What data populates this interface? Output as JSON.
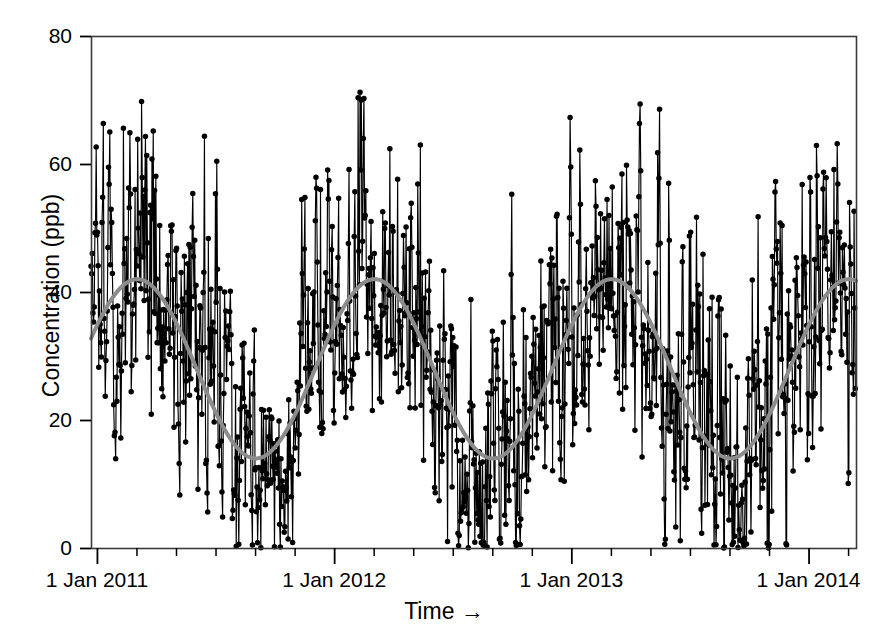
{
  "chart_data": {
    "type": "line",
    "title": "",
    "subtitle": "",
    "xlabel": "Time →",
    "ylabel": "Concentration (ppb)",
    "grid": false,
    "legend": null,
    "x_axis": {
      "tick_labels": [
        "1 Jan 2011",
        "1 Jan 2012",
        "1 Jan 2013",
        "1 Jan 2014"
      ],
      "tick_values": [
        2011.0,
        2012.0,
        2013.0,
        2014.0
      ],
      "range": [
        2010.975,
        2014.2
      ],
      "minor_tick_interval_months": 2
    },
    "y_axis": {
      "tick_labels": [
        "0",
        "20",
        "40",
        "60",
        "80"
      ],
      "tick_values": [
        0,
        20,
        40,
        60,
        80
      ],
      "range": [
        0,
        80
      ]
    },
    "series": [
      {
        "name": "Observed concentration",
        "type": "scatter-line",
        "marker": "filled-circle",
        "color": "#000000",
        "description": "Daily observations connected by thin lines, producing dense vertical stems",
        "n_points": 1180,
        "value_range": [
          0,
          71.5
        ],
        "seasonal_peak_months": [
          "Feb",
          "Mar"
        ],
        "seasonal_trough_months": [
          "Aug",
          "Sep"
        ]
      },
      {
        "name": "Fitted seasonal cycle",
        "type": "smooth-sinusoid",
        "color": "#8c8c8c",
        "line_width": 4,
        "baseline": 28.0,
        "amplitude": 14.0,
        "period_years": 1.0,
        "phase_peak_fraction": 0.17,
        "key_points": [
          {
            "x": 2011.0,
            "y": 26.0
          },
          {
            "x": 2011.17,
            "y": 42.4
          },
          {
            "x": 2011.65,
            "y": 14.0
          },
          {
            "x": 2012.17,
            "y": 40.5
          },
          {
            "x": 2012.6,
            "y": 16.8
          },
          {
            "x": 2013.16,
            "y": 41.6
          },
          {
            "x": 2013.66,
            "y": 14.0
          },
          {
            "x": 2014.2,
            "y": 37.0
          }
        ]
      }
    ]
  },
  "plot_geometry": {
    "left": 91,
    "right": 856,
    "top": 36,
    "bottom": 548,
    "frame_color": "#3a3a3a"
  }
}
